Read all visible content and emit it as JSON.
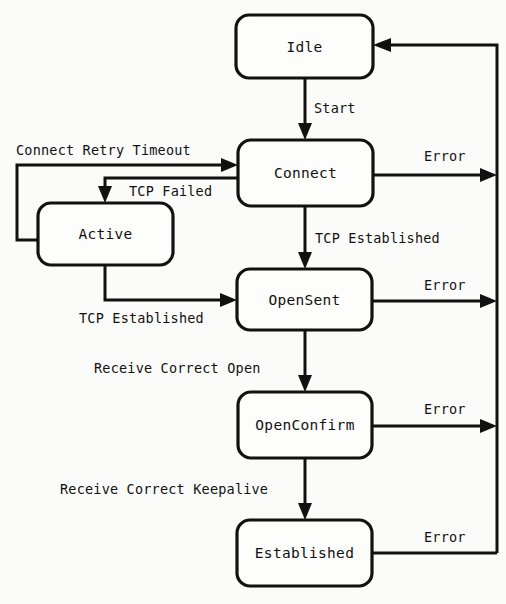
{
  "diagram": {
    "type": "state-machine",
    "background_color": "#fbfbf9",
    "line_color": "#111111",
    "box_fill_color": "#fdfdfb",
    "states": [
      {
        "id": "idle",
        "label": "Idle",
        "x": 236,
        "y": 15,
        "w": 137,
        "h": 63
      },
      {
        "id": "connect",
        "label": "Connect",
        "x": 238,
        "y": 140,
        "w": 135,
        "h": 66
      },
      {
        "id": "active",
        "label": "Active",
        "x": 38,
        "y": 203,
        "w": 135,
        "h": 62
      },
      {
        "id": "opensent",
        "label": "OpenSent",
        "x": 237,
        "y": 269,
        "w": 135,
        "h": 61
      },
      {
        "id": "openconfirm",
        "label": "OpenConfirm",
        "x": 238,
        "y": 392,
        "w": 134,
        "h": 66
      },
      {
        "id": "established",
        "label": "Established",
        "x": 237,
        "y": 520,
        "w": 135,
        "h": 66
      }
    ],
    "transitions": [
      {
        "id": "idle-to-connect",
        "from": "idle",
        "to": "connect",
        "label": "Start"
      },
      {
        "id": "active-to-connect",
        "from": "active",
        "to": "connect",
        "label": "Connect Retry Timeout"
      },
      {
        "id": "connect-to-active",
        "from": "connect",
        "to": "active",
        "label": "TCP Failed"
      },
      {
        "id": "connect-to-opensent",
        "from": "connect",
        "to": "opensent",
        "label": "TCP Established"
      },
      {
        "id": "active-to-opensent",
        "from": "active",
        "to": "opensent",
        "label": "TCP Established"
      },
      {
        "id": "opensent-to-openconfirm",
        "from": "opensent",
        "to": "openconfirm",
        "label": "Receive Correct Open"
      },
      {
        "id": "openconfirm-to-established",
        "from": "openconfirm",
        "to": "established",
        "label": "Receive Correct Keepalive"
      },
      {
        "id": "connect-error",
        "from": "connect",
        "to": "idle",
        "label": "Error"
      },
      {
        "id": "opensent-error",
        "from": "opensent",
        "to": "idle",
        "label": "Error"
      },
      {
        "id": "openconfirm-error",
        "from": "openconfirm",
        "to": "idle",
        "label": "Error"
      },
      {
        "id": "established-error",
        "from": "established",
        "to": "idle",
        "label": "Error"
      }
    ]
  }
}
